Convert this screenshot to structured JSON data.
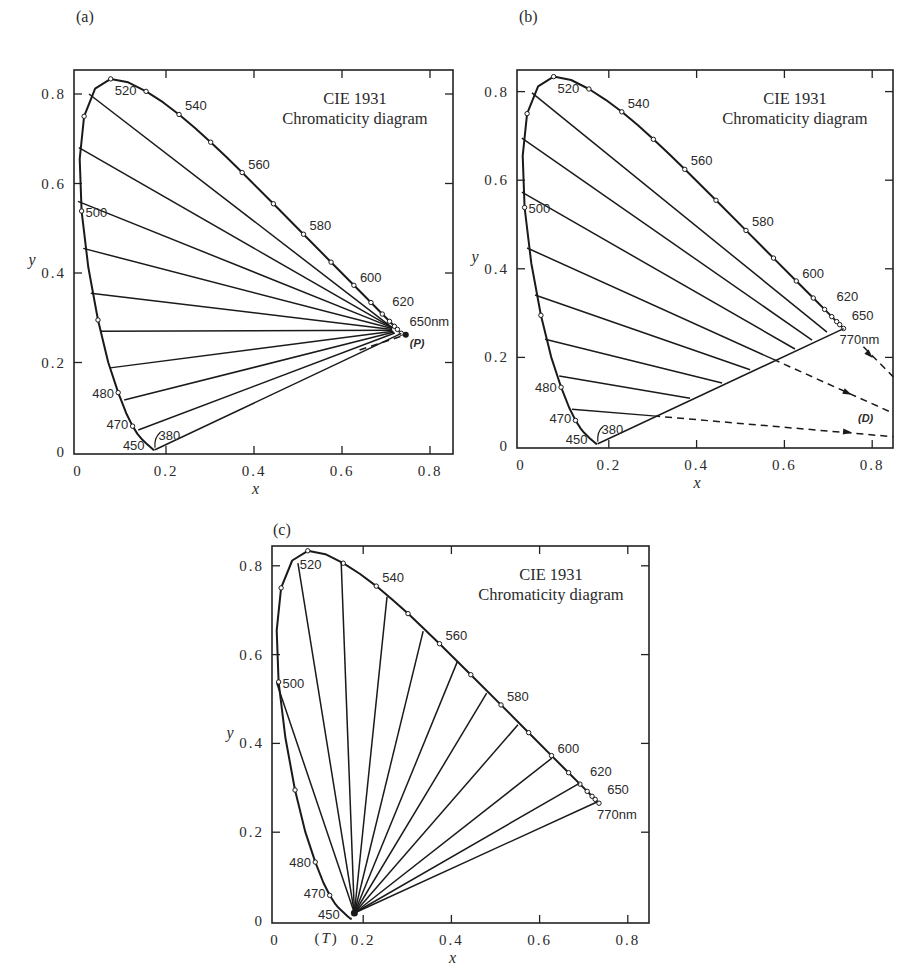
{
  "figure": {
    "caption": ""
  },
  "chart_data": [
    {
      "panel": "a",
      "type": "line",
      "panel_label": "(a)",
      "title": "CIE 1931",
      "subtitle": "Chromaticity diagram",
      "xlabel": "x",
      "ylabel": "y",
      "xlim": [
        0,
        0.85
      ],
      "ylim": [
        0,
        0.85
      ],
      "xticks": [
        0,
        0.2,
        0.4,
        0.6,
        0.8
      ],
      "xtick_labels": [
        "0",
        "0.2",
        "0.4",
        "0.6",
        "0.8"
      ],
      "yticks": [
        0,
        0.2,
        0.4,
        0.6,
        0.8
      ],
      "ytick_labels": [
        "0",
        "0.2",
        "0.4",
        "0.6",
        "0.8"
      ],
      "wavelength_labels": [
        "520",
        "540",
        "560",
        "580",
        "600",
        "620",
        "650nm",
        "500",
        "480",
        "470",
        "450",
        "380"
      ],
      "special_point": {
        "label": "(P)",
        "x": 0.745,
        "y": 0.262
      },
      "lines_description": "Tie lines from the blue/green side of the spectral locus converge to the red end near 650nm; a dashed segment extends to point P.",
      "tie_lines": [
        {
          "from": [
            0.025,
            0.8
          ],
          "to": [
            0.714,
            0.278
          ]
        },
        {
          "from": [
            0.002,
            0.68
          ],
          "to": [
            0.714,
            0.278
          ]
        },
        {
          "from": [
            0.0,
            0.56
          ],
          "to": [
            0.714,
            0.278
          ]
        },
        {
          "from": [
            0.012,
            0.455
          ],
          "to": [
            0.714,
            0.276
          ]
        },
        {
          "from": [
            0.029,
            0.355
          ],
          "to": [
            0.714,
            0.274
          ]
        },
        {
          "from": [
            0.05,
            0.27
          ],
          "to": [
            0.714,
            0.272
          ]
        },
        {
          "from": [
            0.073,
            0.188
          ],
          "to": [
            0.716,
            0.27
          ]
        },
        {
          "from": [
            0.105,
            0.116
          ],
          "to": [
            0.718,
            0.268
          ]
        },
        {
          "from": [
            0.137,
            0.049
          ],
          "to": [
            0.72,
            0.266
          ]
        },
        {
          "from": [
            0.175,
            0.005
          ],
          "to": [
            0.735,
            0.265
          ]
        }
      ],
      "dashed_lines": [
        {
          "from": [
            0.64,
            0.228
          ],
          "to": [
            0.745,
            0.262
          ]
        }
      ],
      "arrows": []
    },
    {
      "panel": "b",
      "type": "line",
      "panel_label": "(b)",
      "title": "CIE 1931",
      "subtitle": "Chromaticity diagram",
      "xlabel": "x",
      "ylabel": "y",
      "xlim": [
        0,
        0.85
      ],
      "ylim": [
        0,
        0.85
      ],
      "xticks": [
        0,
        0.2,
        0.4,
        0.6,
        0.8
      ],
      "xtick_labels": [
        "0",
        "0.2",
        "0.4",
        "0.6",
        "0.8"
      ],
      "yticks": [
        0,
        0.2,
        0.4,
        0.6,
        0.8
      ],
      "ytick_labels": [
        "0",
        "0.2",
        "0.4",
        "0.6",
        "0.8"
      ],
      "wavelength_labels": [
        "520",
        "540",
        "560",
        "580",
        "600",
        "620",
        "650",
        "770nm",
        "500",
        "480",
        "470",
        "450",
        "380"
      ],
      "special_point": {
        "label": "(D)",
        "x": 0.8,
        "y": 0.06
      },
      "lines_description": "Parallel lines from the spectral locus terminate on the purple line (380-770nm); dashed extensions point toward D outside the diagram.",
      "tie_lines": [
        {
          "from": [
            0.025,
            0.797
          ],
          "to": [
            0.697,
            0.257
          ]
        },
        {
          "from": [
            0.002,
            0.695
          ],
          "to": [
            0.663,
            0.239
          ]
        },
        {
          "from": [
            0.002,
            0.573
          ],
          "to": [
            0.624,
            0.219
          ]
        },
        {
          "from": [
            0.014,
            0.447
          ],
          "to": [
            0.574,
            0.196
          ]
        },
        {
          "from": [
            0.032,
            0.341
          ],
          "to": [
            0.522,
            0.172
          ]
        },
        {
          "from": [
            0.055,
            0.241
          ],
          "to": [
            0.458,
            0.142
          ]
        },
        {
          "from": [
            0.087,
            0.158
          ],
          "to": [
            0.385,
            0.108
          ]
        },
        {
          "from": [
            0.116,
            0.083
          ],
          "to": [
            0.301,
            0.068
          ]
        },
        {
          "from": [
            0.175,
            0.005
          ],
          "to": [
            0.735,
            0.265
          ]
        }
      ],
      "dashed_lines": [
        {
          "from": [
            0.301,
            0.068
          ],
          "to": [
            0.848,
            0.021
          ]
        },
        {
          "from": [
            0.574,
            0.196
          ],
          "to": [
            0.848,
            0.074
          ]
        },
        {
          "from": [
            0.78,
            0.224
          ],
          "to": [
            0.848,
            0.156
          ]
        }
      ],
      "arrows": [
        {
          "at": [
            0.745,
            0.0315
          ],
          "dir": [
            1,
            -0.086
          ]
        },
        {
          "at": [
            0.745,
            0.1195
          ],
          "dir": [
            1,
            -0.445
          ]
        },
        {
          "at": [
            0.795,
            0.205
          ],
          "dir": [
            1,
            -1.0
          ]
        }
      ]
    },
    {
      "panel": "c",
      "type": "line",
      "panel_label": "(c)",
      "title": "CIE 1931",
      "subtitle": "Chromaticity diagram",
      "xlabel": "x",
      "ylabel": "y",
      "xlim": [
        0,
        0.85
      ],
      "ylim": [
        0,
        0.85
      ],
      "xticks": [
        0,
        0.2,
        0.4,
        0.6,
        0.8
      ],
      "xtick_labels": [
        "0",
        "0.2",
        "0.4",
        "0.6",
        "0.8"
      ],
      "yticks": [
        0,
        0.2,
        0.4,
        0.6,
        0.8
      ],
      "ytick_labels": [
        "0",
        "0.2",
        "0.4",
        "0.6",
        "0.8"
      ],
      "wavelength_labels": [
        "520",
        "540",
        "560",
        "580",
        "600",
        "620",
        "650",
        "770nm",
        "500",
        "480",
        "470",
        "450"
      ],
      "special_point": {
        "label": "(T)",
        "x": 0.18,
        "y": 0.018
      },
      "lines_description": "Rays fan out from point T near (0.18, 0.02) to the spectral locus.",
      "tie_lines": [
        {
          "from": [
            0.18,
            0.018
          ],
          "to": [
            0.004,
            0.536
          ]
        },
        {
          "from": [
            0.18,
            0.018
          ],
          "to": [
            0.052,
            0.806
          ]
        },
        {
          "from": [
            0.18,
            0.018
          ],
          "to": [
            0.15,
            0.81
          ]
        },
        {
          "from": [
            0.18,
            0.018
          ],
          "to": [
            0.254,
            0.73
          ]
        },
        {
          "from": [
            0.18,
            0.018
          ],
          "to": [
            0.336,
            0.653
          ]
        },
        {
          "from": [
            0.18,
            0.018
          ],
          "to": [
            0.413,
            0.583
          ]
        },
        {
          "from": [
            0.18,
            0.018
          ],
          "to": [
            0.48,
            0.513
          ]
        },
        {
          "from": [
            0.18,
            0.018
          ],
          "to": [
            0.551,
            0.442
          ]
        },
        {
          "from": [
            0.18,
            0.018
          ],
          "to": [
            0.628,
            0.367
          ]
        },
        {
          "from": [
            0.18,
            0.018
          ],
          "to": [
            0.69,
            0.31
          ]
        },
        {
          "from": [
            0.18,
            0.018
          ],
          "to": [
            0.73,
            0.268
          ]
        }
      ],
      "dashed_lines": [],
      "arrows": []
    }
  ],
  "spectral_locus": {
    "wavelengths": [
      380,
      420,
      440,
      450,
      460,
      465,
      470,
      475,
      480,
      485,
      490,
      495,
      500,
      505,
      510,
      515,
      520,
      525,
      530,
      535,
      540,
      545,
      550,
      555,
      560,
      570,
      580,
      590,
      600,
      610,
      620,
      630,
      640,
      650,
      680,
      770
    ],
    "x": [
      0.1741,
      0.1714,
      0.1644,
      0.1566,
      0.144,
      0.1355,
      0.1241,
      0.1096,
      0.0913,
      0.0687,
      0.0454,
      0.0235,
      0.0082,
      0.0039,
      0.0139,
      0.0389,
      0.0743,
      0.1142,
      0.1547,
      0.1929,
      0.2296,
      0.2658,
      0.3016,
      0.3373,
      0.3731,
      0.4441,
      0.5125,
      0.5752,
      0.627,
      0.6658,
      0.6915,
      0.7079,
      0.719,
      0.726,
      0.7334,
      0.7347
    ],
    "y": [
      0.005,
      0.0051,
      0.0109,
      0.0177,
      0.0297,
      0.0399,
      0.0578,
      0.0868,
      0.1327,
      0.2007,
      0.295,
      0.4127,
      0.5384,
      0.6548,
      0.7502,
      0.812,
      0.8338,
      0.8262,
      0.8059,
      0.7816,
      0.7543,
      0.7243,
      0.6923,
      0.6589,
      0.6245,
      0.5547,
      0.4866,
      0.4242,
      0.3725,
      0.334,
      0.3083,
      0.292,
      0.2809,
      0.274,
      0.2666,
      0.2653
    ],
    "marker_wavelengths": [
      470,
      480,
      490,
      500,
      510,
      520,
      530,
      540,
      550,
      560,
      570,
      580,
      590,
      600,
      610,
      620,
      630,
      640,
      650,
      770
    ]
  }
}
